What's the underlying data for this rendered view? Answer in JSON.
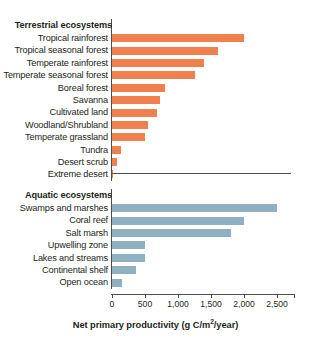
{
  "chart_data": {
    "type": "bar",
    "orientation": "horizontal",
    "title": "",
    "xlabel": "Net primary productivity (g C/m2/year)",
    "ylabel": "",
    "xlim": [
      0,
      2750
    ],
    "grid": false,
    "legend": "none",
    "tick_labels": [
      "0",
      "500",
      "1,000",
      "1,500",
      "2,000",
      "2,500"
    ],
    "tick_values": [
      0,
      500,
      1000,
      1500,
      2000,
      2500
    ],
    "groups": [
      {
        "name": "Terrestrial ecosystems",
        "color": "#F0804E",
        "categories": [
          "Tropical rainforest",
          "Tropical seasonal forest",
          "Temperate rainforest",
          "Temperate seasonal forest",
          "Boreal forest",
          "Savanna",
          "Cultivated land",
          "Woodland/Shrubland",
          "Temperate grassland",
          "Tundra",
          "Desert scrub",
          "Extreme desert"
        ],
        "values": [
          2000,
          1600,
          1400,
          1250,
          800,
          720,
          680,
          550,
          500,
          140,
          80,
          20
        ]
      },
      {
        "name": "Aquatic ecosystems",
        "color": "#8FB0C0",
        "categories": [
          "Swamps and marshes",
          "Coral reef",
          "Salt marsh",
          "Upwelling zone",
          "Lakes and streams",
          "Continental shelf",
          "Open ocean"
        ],
        "values": [
          2500,
          2000,
          1800,
          500,
          500,
          360,
          150
        ]
      }
    ]
  },
  "axis": {
    "title_main": "Net primary productivity (g C/m",
    "title_sup": "2",
    "title_tail": "/year)"
  },
  "colors": {
    "terrestrial_bar": "#F0804E",
    "aquatic_bar": "#8FB0C0",
    "axis": "#4d4d4f",
    "text": "#231f20",
    "background": "#ffffff"
  }
}
